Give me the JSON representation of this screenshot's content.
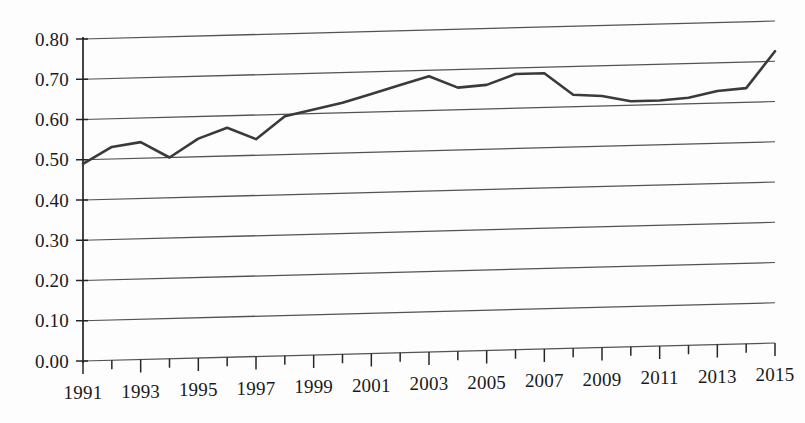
{
  "chart_data": {
    "type": "line",
    "title": "",
    "subtitle": "",
    "xlabel": "",
    "ylabel": "",
    "x": [
      1991,
      1992,
      1993,
      1994,
      1995,
      1996,
      1997,
      1998,
      1999,
      2000,
      2001,
      2002,
      2003,
      2004,
      2005,
      2006,
      2007,
      2008,
      2009,
      2010,
      2011,
      2012,
      2013,
      2014,
      2015
    ],
    "values": [
      0.49,
      0.53,
      0.54,
      0.5,
      0.545,
      0.57,
      0.54,
      0.595,
      0.61,
      0.625,
      0.645,
      0.665,
      0.685,
      0.655,
      0.66,
      0.685,
      0.685,
      0.63,
      0.625,
      0.61,
      0.61,
      0.615,
      0.63,
      0.635,
      0.725
    ],
    "series": [
      {
        "name": "series-1",
        "values": [
          0.49,
          0.53,
          0.54,
          0.5,
          0.545,
          0.57,
          0.54,
          0.595,
          0.61,
          0.625,
          0.645,
          0.665,
          0.685,
          0.655,
          0.66,
          0.685,
          0.685,
          0.63,
          0.625,
          0.61,
          0.61,
          0.615,
          0.63,
          0.635,
          0.725
        ]
      }
    ],
    "categories": [
      "1991",
      "1992",
      "1993",
      "1994",
      "1995",
      "1996",
      "1997",
      "1998",
      "1999",
      "2000",
      "2001",
      "2002",
      "2003",
      "2004",
      "2005",
      "2006",
      "2007",
      "2008",
      "2009",
      "2010",
      "2011",
      "2012",
      "2013",
      "2014",
      "2015"
    ],
    "ylim": [
      0.0,
      0.8
    ],
    "xlim": [
      1991,
      2015
    ],
    "ytick_labels": [
      "0.00",
      "0.10",
      "0.20",
      "0.30",
      "0.40",
      "0.50",
      "0.60",
      "0.70",
      "0.80"
    ],
    "ytick_values": [
      0.0,
      0.1,
      0.2,
      0.3,
      0.4,
      0.5,
      0.6,
      0.7,
      0.8
    ],
    "xtick_labels": [
      "1991",
      "1993",
      "1995",
      "1997",
      "1999",
      "2001",
      "2003",
      "2005",
      "2007",
      "2009",
      "2011",
      "2013",
      "2015"
    ],
    "xtick_values": [
      1991,
      1993,
      1995,
      1997,
      1999,
      2001,
      2003,
      2005,
      2007,
      2009,
      2011,
      2013,
      2015
    ],
    "grid": true,
    "grid_axis": "y",
    "legend": false,
    "legend_position": "none",
    "annotations": [],
    "colors": {
      "line": "#3a3a3a",
      "grid": "#2d2d2d",
      "axis": "#232323",
      "background": "#fdfdfd",
      "text": "#1a1a1a"
    }
  }
}
